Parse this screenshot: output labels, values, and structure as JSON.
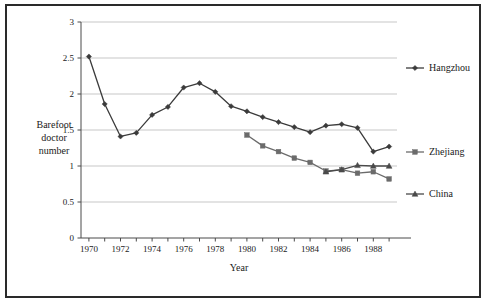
{
  "chart_data": {
    "type": "line",
    "title": "",
    "xlabel": "Year",
    "ylabel": "Barefoot doctor number",
    "ylabel_lines": [
      "Barefoot",
      "doctor",
      "number"
    ],
    "xlim": [
      1969.5,
      1989.5
    ],
    "ylim": [
      0,
      3
    ],
    "yticks": [
      0,
      0.5,
      1,
      1.5,
      2,
      2.5,
      3
    ],
    "ytick_labels": [
      "0",
      "0.5",
      "1",
      "1.5",
      "2",
      "2.5",
      "3"
    ],
    "xticks": [
      1970,
      1971,
      1972,
      1973,
      1974,
      1975,
      1976,
      1977,
      1978,
      1979,
      1980,
      1981,
      1982,
      1983,
      1984,
      1985,
      1986,
      1987,
      1988,
      1989
    ],
    "xtick_labels_shown": [
      "1970",
      "1972",
      "1974",
      "1976",
      "1978",
      "1980",
      "1982",
      "1984",
      "1986",
      "1988"
    ],
    "grid": "horizontal",
    "legend_position": "right",
    "series": [
      {
        "name": "Hangzhou",
        "marker": "diamond",
        "color": "#3b3b3b",
        "x": [
          1970,
          1971,
          1972,
          1973,
          1974,
          1975,
          1976,
          1977,
          1978,
          1979,
          1980,
          1981,
          1982,
          1983,
          1984,
          1985,
          1986,
          1987,
          1988,
          1989
        ],
        "values": [
          2.52,
          1.86,
          1.41,
          1.46,
          1.71,
          1.82,
          2.09,
          2.15,
          2.03,
          1.83,
          1.76,
          1.68,
          1.61,
          1.54,
          1.47,
          1.56,
          1.58,
          1.53,
          1.2,
          1.27
        ]
      },
      {
        "name": "Zhejiang",
        "marker": "square",
        "color": "#6b6b6b",
        "x": [
          1980,
          1981,
          1982,
          1983,
          1984,
          1985,
          1986,
          1987,
          1988,
          1989
        ],
        "values": [
          1.43,
          1.28,
          1.2,
          1.11,
          1.05,
          0.93,
          0.95,
          0.9,
          0.92,
          0.82
        ]
      },
      {
        "name": "China",
        "marker": "triangle",
        "color": "#4a4a4a",
        "x": [
          1985,
          1986,
          1987,
          1988,
          1989
        ],
        "values": [
          0.92,
          0.95,
          1.01,
          1.0,
          1.0
        ]
      }
    ]
  },
  "legend": {
    "items": [
      {
        "label": "Hangzhou",
        "marker": "diamond"
      },
      {
        "label": "Zhejiang",
        "marker": "square"
      },
      {
        "label": "China",
        "marker": "triangle"
      }
    ]
  }
}
